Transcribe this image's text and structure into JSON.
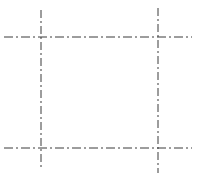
{
  "canvas": {
    "width": 203,
    "height": 177,
    "background_color": "#ffffff",
    "title": "Center line construction rectangle"
  },
  "style": {
    "line_color": "#3a3a3a",
    "line_width": 1,
    "line_style": "dash-dot",
    "dash_pattern": "9 3 2 3",
    "dash_pattern_vertical": "8 3 2 3"
  },
  "chart_data": {
    "type": "diagram",
    "xlabel": "",
    "ylabel": "",
    "xlim": [
      0,
      203
    ],
    "ylim": [
      0,
      177
    ],
    "grid": false,
    "legend": "none",
    "lines": [
      {
        "name": "top-horizontal-centerline",
        "orientation": "horizontal",
        "x1": 4,
        "y1": 37,
        "x2": 192,
        "y2": 37,
        "style": "dash-dot"
      },
      {
        "name": "bottom-horizontal-centerline",
        "orientation": "horizontal",
        "x1": 4,
        "y1": 148,
        "x2": 192,
        "y2": 148,
        "style": "dash-dot"
      },
      {
        "name": "left-vertical-centerline",
        "orientation": "vertical",
        "x1": 41,
        "y1": 10,
        "x2": 41,
        "y2": 169,
        "style": "dash-dot"
      },
      {
        "name": "right-vertical-centerline",
        "orientation": "vertical",
        "x1": 158,
        "y1": 8,
        "x2": 158,
        "y2": 173,
        "style": "dash-dot"
      }
    ],
    "intersections": [
      {
        "name": "top-left-intersection",
        "x": 41,
        "y": 37
      },
      {
        "name": "top-right-intersection",
        "x": 158,
        "y": 37
      },
      {
        "name": "bottom-left-intersection",
        "x": 41,
        "y": 148
      },
      {
        "name": "bottom-right-intersection",
        "x": 158,
        "y": 148
      }
    ],
    "enclosed_region": {
      "name": "center-rectangle",
      "x": 41,
      "y": 37,
      "width": 117,
      "height": 111
    }
  }
}
